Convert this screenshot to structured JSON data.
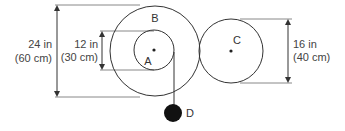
{
  "diagram": {
    "type": "pulley-gear system",
    "labels": {
      "A": "A",
      "B": "B",
      "C": "C",
      "D": "D"
    },
    "dimensions": {
      "outer": {
        "line1": "24 in",
        "line2": "(60 cm)"
      },
      "inner": {
        "line1": "12 in",
        "line2": "(30 cm)"
      },
      "right": {
        "line1": "16 in",
        "line2": "(40 cm)"
      }
    },
    "colors": {
      "line": "#333333",
      "extension": "#888888",
      "weight": "#111111"
    }
  }
}
